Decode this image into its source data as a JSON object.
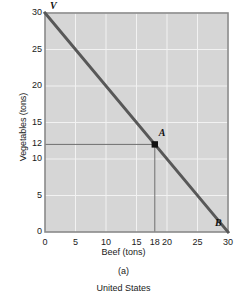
{
  "chart_data": {
    "type": "line",
    "title": "",
    "xlabel": "Beef (tons)",
    "ylabel": "Vegetables (tons)",
    "xlim": [
      0,
      30
    ],
    "ylim": [
      0,
      30
    ],
    "grid": true,
    "legend": "none",
    "xticks": [
      0,
      5,
      10,
      15,
      18,
      20,
      25,
      30
    ],
    "xtick_labels": [
      "0",
      "5",
      "10",
      "15",
      "18",
      "20",
      "25",
      "30"
    ],
    "yticks": [
      0,
      5,
      10,
      12,
      15,
      20,
      25,
      30
    ],
    "ytick_labels": [
      "0",
      "5",
      "10",
      "12",
      "15",
      "20",
      "25",
      "30"
    ],
    "series": [
      {
        "name": "Production possibilities frontier",
        "x": [
          0,
          30
        ],
        "values": [
          30,
          0
        ],
        "color": "#585858"
      }
    ],
    "points": [
      {
        "label": "V",
        "x": 0,
        "y": 30,
        "marker": "none"
      },
      {
        "label": "A",
        "x": 18,
        "y": 12,
        "marker": "square"
      },
      {
        "label": "B",
        "x": 30,
        "y": 0,
        "marker": "none"
      }
    ],
    "guide_lines": [
      {
        "name": "horizontal-guide-at-12",
        "from": [
          0,
          12
        ],
        "to": [
          18,
          12
        ]
      },
      {
        "name": "vertical-guide-at-18",
        "from": [
          18,
          0
        ],
        "to": [
          18,
          12
        ]
      }
    ],
    "annotations": [
      "V",
      "A",
      "B"
    ],
    "plot_background": "#d6d6d6",
    "grid_color": "#f2f2f2",
    "axis_color": "#8a8a8a"
  },
  "caption": {
    "panel_letter": "(a)",
    "panel_title": "United States"
  },
  "axes": {
    "x_title": "Beef (tons)",
    "y_title": "Vegetables (tons)"
  }
}
